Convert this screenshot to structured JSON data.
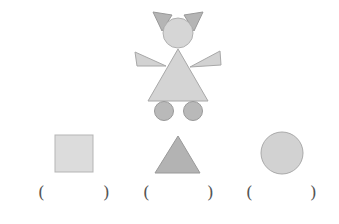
{
  "colors": {
    "dark_fill": "#b3b3b3",
    "light_fill": "#d4d4d4",
    "lighter_fill": "#dcdcdc",
    "stroke": "#9a9a9a",
    "text": "#555555"
  },
  "figure": {
    "parts": [
      {
        "name": "left-ear",
        "shape": "triangle"
      },
      {
        "name": "right-ear",
        "shape": "triangle"
      },
      {
        "name": "head",
        "shape": "circle"
      },
      {
        "name": "left-arm",
        "shape": "triangle"
      },
      {
        "name": "right-arm",
        "shape": "triangle"
      },
      {
        "name": "body",
        "shape": "triangle"
      },
      {
        "name": "left-foot",
        "shape": "circle"
      },
      {
        "name": "right-foot",
        "shape": "circle"
      }
    ]
  },
  "options": [
    {
      "shape": "square",
      "blank_open": "(",
      "blank_close": ")"
    },
    {
      "shape": "triangle",
      "blank_open": "(",
      "blank_close": ")"
    },
    {
      "shape": "circle",
      "blank_open": "(",
      "blank_close": ")"
    }
  ]
}
